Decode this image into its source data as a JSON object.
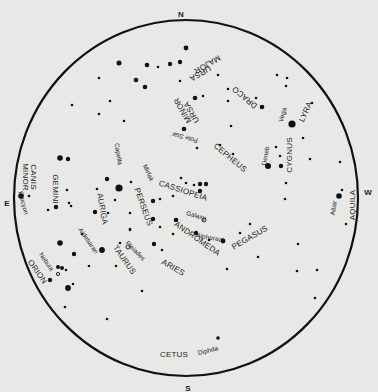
{
  "map": {
    "type": "star-chart",
    "background": "#e8e8e6",
    "ink": "#111111",
    "horizon": {
      "cx": 186,
      "cy": 198,
      "rx": 172,
      "ry": 178,
      "stroke_width": 2.2
    },
    "directions": [
      {
        "label": "N",
        "x": 181,
        "y": 15
      },
      {
        "label": "S",
        "x": 188,
        "y": 389
      },
      {
        "label": "E",
        "x": 7,
        "y": 204
      },
      {
        "label": "W",
        "x": 368,
        "y": 193
      }
    ],
    "constellations": [
      {
        "label": "URSA",
        "x": 200,
        "y": 73,
        "rot": 150
      },
      {
        "label": "MAJOR",
        "x": 207,
        "y": 64,
        "rot": 150
      },
      {
        "label": "URSA",
        "x": 192,
        "y": 112,
        "rot": 240
      },
      {
        "label": "MINOR",
        "x": 183,
        "y": 110,
        "rot": 240
      },
      {
        "label": "DRACO",
        "x": 245,
        "y": 97,
        "rot": 220
      },
      {
        "label": "LYRA",
        "x": 306,
        "y": 112,
        "rot": -65
      },
      {
        "label": "CYGNUS",
        "x": 290,
        "y": 155,
        "rot": 270
      },
      {
        "label": "CEPHEUS",
        "x": 230,
        "y": 158,
        "rot": 40
      },
      {
        "label": "CASSIOPEIA",
        "x": 183,
        "y": 191,
        "rot": 18
      },
      {
        "label": "AQUILA",
        "x": 353,
        "y": 205,
        "rot": -90
      },
      {
        "label": "CANIS",
        "x": 33,
        "y": 177,
        "rot": 90
      },
      {
        "label": "MINOR",
        "x": 25,
        "y": 177,
        "rot": 90
      },
      {
        "label": "GEMINI",
        "x": 55,
        "y": 189,
        "rot": 90
      },
      {
        "label": "AURIGA",
        "x": 102,
        "y": 209,
        "rot": 80
      },
      {
        "label": "PERSEUS",
        "x": 143,
        "y": 207,
        "rot": 70
      },
      {
        "label": "ANDROMEDA",
        "x": 197,
        "y": 239,
        "rot": 35
      },
      {
        "label": "PEGASUS",
        "x": 250,
        "y": 238,
        "rot": -30
      },
      {
        "label": "TAURUS",
        "x": 124,
        "y": 260,
        "rot": 55
      },
      {
        "label": "ARIES",
        "x": 173,
        "y": 268,
        "rot": 30
      },
      {
        "label": "ORION",
        "x": 37,
        "y": 272,
        "rot": 55
      },
      {
        "label": "CETUS",
        "x": 174,
        "y": 355,
        "rot": 0
      }
    ],
    "named_stars": [
      {
        "label": "Pole Star",
        "x": 185,
        "y": 137,
        "rot": 195
      },
      {
        "label": "Vega",
        "x": 283,
        "y": 115,
        "rot": -75
      },
      {
        "label": "Deneb",
        "x": 266,
        "y": 156,
        "rot": -80
      },
      {
        "label": "Altair",
        "x": 334,
        "y": 208,
        "rot": -80
      },
      {
        "label": "Capella",
        "x": 118,
        "y": 154,
        "rot": 80
      },
      {
        "label": "Mirfak",
        "x": 148,
        "y": 173,
        "rot": 65
      },
      {
        "label": "Galaxy",
        "x": 196,
        "y": 216,
        "rot": 15
      },
      {
        "label": "Alpherazt",
        "x": 210,
        "y": 238,
        "rot": 10
      },
      {
        "label": "Procyon",
        "x": 23,
        "y": 203,
        "rot": 75
      },
      {
        "label": "Aldebaran",
        "x": 88,
        "y": 241,
        "rot": 55
      },
      {
        "label": "Pleiades",
        "x": 135,
        "y": 251,
        "rot": 45
      },
      {
        "label": "Nebula",
        "x": 46,
        "y": 262,
        "rot": 55
      },
      {
        "label": "Diphda",
        "x": 208,
        "y": 351,
        "rot": -15
      }
    ],
    "stars": [
      {
        "x": 119,
        "y": 63,
        "r": 2.5
      },
      {
        "x": 186,
        "y": 48,
        "r": 2.4
      },
      {
        "x": 180,
        "y": 62,
        "r": 2.2
      },
      {
        "x": 180,
        "y": 81,
        "r": 1.3
      },
      {
        "x": 170,
        "y": 64,
        "r": 2.2
      },
      {
        "x": 158,
        "y": 67,
        "r": 1.3
      },
      {
        "x": 147,
        "y": 65,
        "r": 2.3
      },
      {
        "x": 136,
        "y": 80,
        "r": 2.3
      },
      {
        "x": 145,
        "y": 87,
        "r": 2.3
      },
      {
        "x": 99,
        "y": 78,
        "r": 1.3
      },
      {
        "x": 110,
        "y": 101,
        "r": 1.3
      },
      {
        "x": 72,
        "y": 105,
        "r": 1.3
      },
      {
        "x": 99,
        "y": 114,
        "r": 1.3
      },
      {
        "x": 124,
        "y": 121,
        "r": 1.3
      },
      {
        "x": 195,
        "y": 98,
        "r": 2.3
      },
      {
        "x": 203,
        "y": 96,
        "r": 1.3
      },
      {
        "x": 184,
        "y": 129,
        "r": 2.3
      },
      {
        "x": 218,
        "y": 75,
        "r": 1.3
      },
      {
        "x": 228,
        "y": 89,
        "r": 1.3
      },
      {
        "x": 228,
        "y": 101,
        "r": 1.3
      },
      {
        "x": 256,
        "y": 98,
        "r": 1.3
      },
      {
        "x": 262,
        "y": 107,
        "r": 2.3
      },
      {
        "x": 231,
        "y": 126,
        "r": 1.3
      },
      {
        "x": 197,
        "y": 148,
        "r": 1.3
      },
      {
        "x": 220,
        "y": 145,
        "r": 1.3
      },
      {
        "x": 233,
        "y": 154,
        "r": 1.3
      },
      {
        "x": 277,
        "y": 75,
        "r": 1.3
      },
      {
        "x": 287,
        "y": 78,
        "r": 1.3
      },
      {
        "x": 286,
        "y": 86,
        "r": 1.3
      },
      {
        "x": 312,
        "y": 103,
        "r": 1.3
      },
      {
        "x": 292,
        "y": 124,
        "r": 3.6
      },
      {
        "x": 303,
        "y": 138,
        "r": 1.3
      },
      {
        "x": 276,
        "y": 147,
        "r": 1.3
      },
      {
        "x": 280,
        "y": 156,
        "r": 1.3
      },
      {
        "x": 268,
        "y": 166,
        "r": 3.0
      },
      {
        "x": 281,
        "y": 166,
        "r": 2.2
      },
      {
        "x": 286,
        "y": 183,
        "r": 1.3
      },
      {
        "x": 310,
        "y": 159,
        "r": 1.3
      },
      {
        "x": 340,
        "y": 162,
        "r": 1.3
      },
      {
        "x": 339,
        "y": 196,
        "r": 2.8
      },
      {
        "x": 342,
        "y": 190,
        "r": 1.3
      },
      {
        "x": 346,
        "y": 224,
        "r": 1.3
      },
      {
        "x": 285,
        "y": 199,
        "r": 1.3
      },
      {
        "x": 186,
        "y": 183,
        "r": 1.3
      },
      {
        "x": 194,
        "y": 185,
        "r": 1.3
      },
      {
        "x": 200,
        "y": 184,
        "r": 2.2
      },
      {
        "x": 206,
        "y": 184,
        "r": 2.2
      },
      {
        "x": 200,
        "y": 191,
        "r": 2.2
      },
      {
        "x": 181,
        "y": 178,
        "r": 1.3
      },
      {
        "x": 160,
        "y": 199,
        "r": 1.3
      },
      {
        "x": 153,
        "y": 201,
        "r": 2.2
      },
      {
        "x": 131,
        "y": 182,
        "r": 1.3
      },
      {
        "x": 119,
        "y": 188,
        "r": 3.6
      },
      {
        "x": 107,
        "y": 179,
        "r": 2.2
      },
      {
        "x": 97,
        "y": 189,
        "r": 1.3
      },
      {
        "x": 115,
        "y": 200,
        "r": 1.3
      },
      {
        "x": 95,
        "y": 212,
        "r": 2.2
      },
      {
        "x": 108,
        "y": 213,
        "r": 1.3
      },
      {
        "x": 130,
        "y": 213,
        "r": 1.3
      },
      {
        "x": 153,
        "y": 219,
        "r": 2.2
      },
      {
        "x": 160,
        "y": 227,
        "r": 1.3
      },
      {
        "x": 130,
        "y": 229,
        "r": 1.3
      },
      {
        "x": 120,
        "y": 243,
        "r": 1.3
      },
      {
        "x": 176,
        "y": 220,
        "r": 2.3
      },
      {
        "x": 173,
        "y": 234,
        "r": 1.3
      },
      {
        "x": 196,
        "y": 233,
        "r": 2.2
      },
      {
        "x": 209,
        "y": 240,
        "r": 1.3
      },
      {
        "x": 223,
        "y": 241,
        "r": 2.4
      },
      {
        "x": 240,
        "y": 233,
        "r": 1.3
      },
      {
        "x": 250,
        "y": 224,
        "r": 1.3
      },
      {
        "x": 258,
        "y": 257,
        "r": 1.3
      },
      {
        "x": 227,
        "y": 269,
        "r": 1.3
      },
      {
        "x": 298,
        "y": 244,
        "r": 1.3
      },
      {
        "x": 297,
        "y": 271,
        "r": 1.3
      },
      {
        "x": 317,
        "y": 270,
        "r": 1.3
      },
      {
        "x": 315,
        "y": 298,
        "r": 1.3
      },
      {
        "x": 173,
        "y": 196,
        "r": 1.3
      },
      {
        "x": 154,
        "y": 244,
        "r": 2.2
      },
      {
        "x": 162,
        "y": 250,
        "r": 1.3
      },
      {
        "x": 130,
        "y": 230,
        "r": 1.3
      },
      {
        "x": 102,
        "y": 250,
        "r": 2.9
      },
      {
        "x": 82,
        "y": 234,
        "r": 1.3
      },
      {
        "x": 89,
        "y": 266,
        "r": 1.3
      },
      {
        "x": 116,
        "y": 266,
        "r": 1.3
      },
      {
        "x": 142,
        "y": 291,
        "r": 1.3
      },
      {
        "x": 107,
        "y": 319,
        "r": 1.3
      },
      {
        "x": 21,
        "y": 196,
        "r": 2.8
      },
      {
        "x": 29,
        "y": 196,
        "r": 1.3
      },
      {
        "x": 60,
        "y": 158,
        "r": 2.8
      },
      {
        "x": 68,
        "y": 159,
        "r": 2.2
      },
      {
        "x": 67,
        "y": 190,
        "r": 1.3
      },
      {
        "x": 69,
        "y": 203,
        "r": 1.3
      },
      {
        "x": 71,
        "y": 206,
        "r": 1.3
      },
      {
        "x": 56,
        "y": 207,
        "r": 2.2
      },
      {
        "x": 48,
        "y": 210,
        "r": 1.3
      },
      {
        "x": 60,
        "y": 243,
        "r": 2.8
      },
      {
        "x": 74,
        "y": 254,
        "r": 2.2
      },
      {
        "x": 58,
        "y": 267,
        "r": 2.0
      },
      {
        "x": 62,
        "y": 268,
        "r": 2.0
      },
      {
        "x": 66,
        "y": 270,
        "r": 1.3
      },
      {
        "x": 50,
        "y": 280,
        "r": 2.2
      },
      {
        "x": 68,
        "y": 288,
        "r": 2.9
      },
      {
        "x": 73,
        "y": 284,
        "r": 1.3
      },
      {
        "x": 65,
        "y": 307,
        "r": 1.3
      },
      {
        "x": 218,
        "y": 338,
        "r": 1.8
      }
    ],
    "open_markers": [
      {
        "x": 204,
        "y": 220,
        "r": 2.0
      },
      {
        "x": 128,
        "y": 247,
        "r": 2.0
      },
      {
        "x": 58,
        "y": 274,
        "r": 1.6
      }
    ]
  }
}
